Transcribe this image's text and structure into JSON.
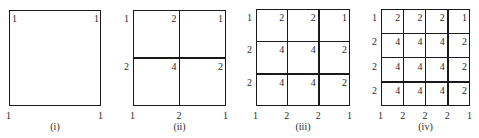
{
  "figure": {
    "panels": [
      {
        "caption": "(i)",
        "n": 1,
        "box": {
          "left": 9,
          "top": 10,
          "right": 101,
          "bottom": 106
        },
        "weights": [
          [
            1,
            1
          ],
          [
            1,
            1
          ]
        ]
      },
      {
        "caption": "(ii)",
        "n": 2,
        "box": {
          "left": 133,
          "top": 10,
          "right": 226,
          "bottom": 106
        },
        "weights": [
          [
            1,
            2,
            1
          ],
          [
            2,
            4,
            2
          ],
          [
            1,
            2,
            1
          ]
        ]
      },
      {
        "caption": "(iii)",
        "n": 3,
        "box": {
          "left": 256,
          "top": 9,
          "right": 350,
          "bottom": 106
        },
        "weights": [
          [
            1,
            2,
            2,
            1
          ],
          [
            2,
            4,
            4,
            2
          ],
          [
            2,
            4,
            4,
            2
          ],
          [
            1,
            2,
            2,
            1
          ]
        ]
      },
      {
        "caption": "(iv)",
        "n": 4,
        "box": {
          "left": 381,
          "top": 9,
          "right": 470,
          "bottom": 106
        },
        "weights": [
          [
            1,
            2,
            2,
            2,
            1
          ],
          [
            2,
            4,
            4,
            4,
            2
          ],
          [
            2,
            4,
            4,
            4,
            2
          ],
          [
            2,
            4,
            4,
            4,
            2
          ],
          [
            1,
            2,
            2,
            2,
            1
          ]
        ]
      }
    ]
  },
  "colors": {
    "line": "#1a1a1a",
    "text": "#2a2a2a",
    "background": "#ffffff"
  }
}
